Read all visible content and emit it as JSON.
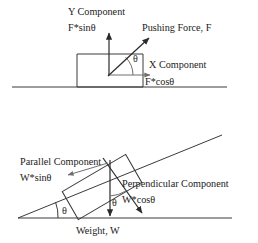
{
  "figure": {
    "colors": {
      "line": "#3a3a3a",
      "thin_line": "#6e6e6e",
      "arrow": "#2a2a2a",
      "text": "#1b1b1b",
      "background": "#ffffff"
    },
    "panels": [
      {
        "id": "pushing-force-panel",
        "name": "Pushing force on a block on level ground",
        "labels": {
          "y_component_title": "Y Component",
          "y_component_formula": "F*sinθ",
          "applied_force": "Pushing Force, F",
          "x_component_title": "X Component",
          "x_component_formula": "F*cosθ",
          "angle": "θ"
        }
      },
      {
        "id": "inclined-plane-panel",
        "name": "Weight components on an inclined plane",
        "labels": {
          "parallel_component_title": "Parallel Component",
          "parallel_component_formula": "W*sinθ",
          "perpendicular_component_title": "Perpendicular Component",
          "perpendicular_component_formula": "W*cosθ",
          "weight": "Weight, W",
          "incline_angle": "θ",
          "vector_angle": "θ"
        }
      }
    ]
  }
}
